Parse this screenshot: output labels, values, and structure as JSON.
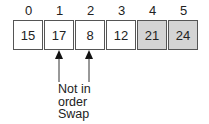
{
  "array": {
    "indices": [
      "0",
      "1",
      "2",
      "3",
      "4",
      "5"
    ],
    "values": [
      "15",
      "17",
      "8",
      "12",
      "21",
      "24"
    ],
    "highlighted": [
      4,
      5
    ],
    "highlight_color": "#d4d4d4"
  },
  "annotation": {
    "arrows_point_to": [
      1,
      2
    ],
    "line1": "Not in",
    "line2": "order",
    "line3": "Swap"
  }
}
